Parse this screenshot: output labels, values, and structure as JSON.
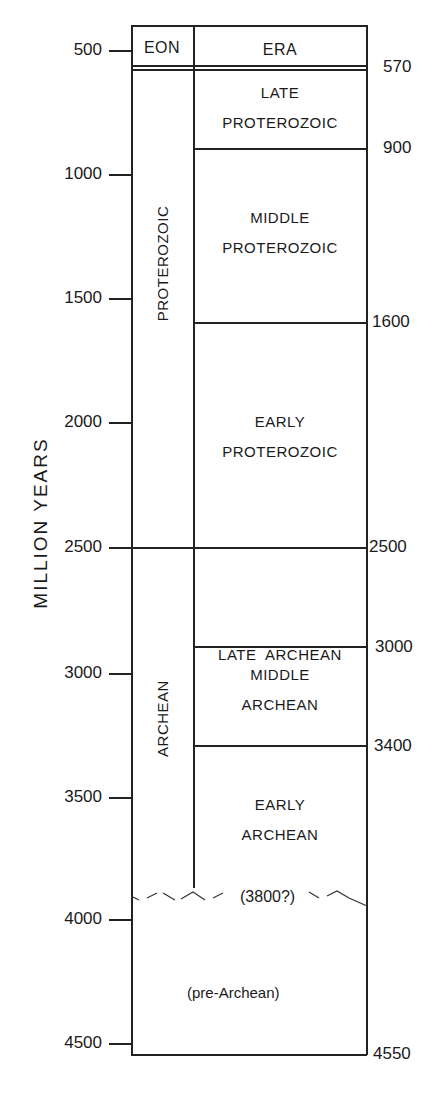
{
  "header": {
    "eon": "EON",
    "era": "ERA"
  },
  "axis": {
    "title": "MILLION YEARS",
    "ticks": [
      "500",
      "1000",
      "1500",
      "2000",
      "2500",
      "3000",
      "3500",
      "4000",
      "4500"
    ]
  },
  "boundaries": [
    "570",
    "900",
    "1600",
    "2500",
    "3000",
    "3400",
    "4550"
  ],
  "eons": [
    {
      "name": "PROTEROZOIC",
      "start": 570,
      "end": 2500
    },
    {
      "name": "ARCHEAN",
      "start": 2500,
      "end": 3800
    }
  ],
  "eras": [
    {
      "line1": "LATE",
      "line2": "PROTEROZOIC",
      "start": 570,
      "end": 900
    },
    {
      "line1": "MIDDLE",
      "line2": "PROTEROZOIC",
      "start": 900,
      "end": 1600
    },
    {
      "line1": "EARLY",
      "line2": "PROTEROZOIC",
      "start": 1600,
      "end": 2500
    },
    {
      "line1": "LATE  ARCHEAN",
      "line2": "",
      "start": 2500,
      "end": 3000
    },
    {
      "line1": "MIDDLE",
      "line2": "ARCHEAN",
      "start": 3000,
      "end": 3400
    },
    {
      "line1": "EARLY",
      "line2": "ARCHEAN",
      "start": 3400,
      "end": 3800
    }
  ],
  "uncertain_boundary": "(3800?)",
  "pre_archean": "(pre-Archean)"
}
